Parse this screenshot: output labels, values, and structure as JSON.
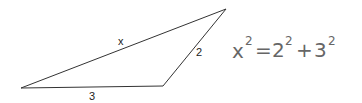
{
  "diagram": {
    "shape": "triangle",
    "vertices": [
      [
        21,
        88
      ],
      [
        163,
        86
      ],
      [
        226,
        9
      ]
    ],
    "stroke_color": "#333333",
    "side_labels": {
      "hypotenuse": "x",
      "right_side": "2",
      "bottom": "3"
    }
  },
  "equation": {
    "lhs_base": "x",
    "lhs_exp": "2",
    "equals": "=",
    "term1_base": "2",
    "term1_exp": "2",
    "plus": "+",
    "term2_base": "3",
    "term2_exp": "2"
  }
}
